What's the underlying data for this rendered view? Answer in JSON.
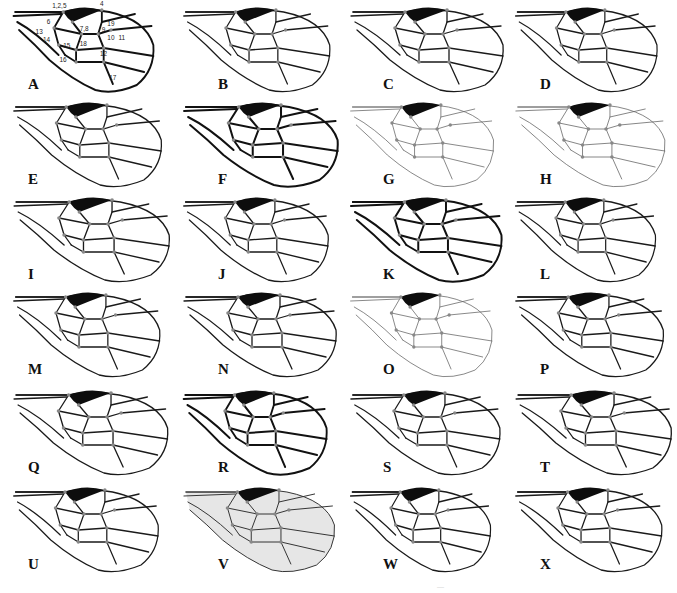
{
  "figure": {
    "type": "wing venation comparison plate",
    "layout": {
      "columns": 4,
      "rows": 6
    },
    "panels": [
      {
        "label": "A",
        "annotated": true,
        "style": "bold"
      },
      {
        "label": "B",
        "style": "normal"
      },
      {
        "label": "C",
        "style": "normal"
      },
      {
        "label": "D",
        "style": "normal"
      },
      {
        "label": "E",
        "style": "normal"
      },
      {
        "label": "F",
        "style": "bold"
      },
      {
        "label": "G",
        "style": "light"
      },
      {
        "label": "H",
        "style": "light"
      },
      {
        "label": "I",
        "style": "normal"
      },
      {
        "label": "J",
        "style": "normal"
      },
      {
        "label": "K",
        "style": "bold"
      },
      {
        "label": "L",
        "style": "normal"
      },
      {
        "label": "M",
        "style": "normal"
      },
      {
        "label": "N",
        "style": "normal"
      },
      {
        "label": "O",
        "style": "light"
      },
      {
        "label": "P",
        "style": "normal"
      },
      {
        "label": "Q",
        "style": "normal"
      },
      {
        "label": "R",
        "style": "bold"
      },
      {
        "label": "S",
        "style": "normal"
      },
      {
        "label": "T",
        "style": "normal"
      },
      {
        "label": "U",
        "style": "normal"
      },
      {
        "label": "V",
        "style": "shaded"
      },
      {
        "label": "W",
        "style": "normal"
      },
      {
        "label": "X",
        "style": "normal"
      }
    ],
    "landmark_numbers": [
      "1",
      "2",
      "5",
      "4",
      "6",
      "13",
      "14",
      "7",
      "8",
      "9",
      "19",
      "10",
      "11",
      "15",
      "18",
      "12",
      "16",
      "17"
    ],
    "landmark_labels": {
      "l1": "1,2,5",
      "l4": "4",
      "l6": "6",
      "l13": "13",
      "l14": "14",
      "l78": "7,8",
      "l9": "9",
      "l19": "19",
      "l10": "10",
      "l11": "11",
      "l15": "15",
      "l18": "18",
      "l12": "12",
      "l16": "16",
      "l17": "17"
    },
    "colors": {
      "vein": "#1a1a1a",
      "stigma": "#0d0d0d",
      "landmark": "#888888",
      "shading": "#e6e6e6"
    }
  }
}
